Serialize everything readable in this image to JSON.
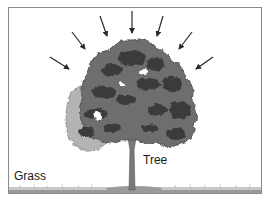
{
  "diagram": {
    "title": "",
    "labels": {
      "tree": "Tree",
      "grass": "Grass"
    },
    "elements": {
      "arrows": {
        "semantic": "sunlight-rays",
        "count": 7,
        "direction": "converging-toward-tree-canopy"
      },
      "tree": {
        "semantic": "tree",
        "parts": [
          "canopy",
          "trunk",
          "branches"
        ]
      },
      "ground": {
        "semantic": "grass-ground-strip"
      }
    },
    "colors": {
      "frame_border": "#8a8a8a",
      "arrow": "#2a2a2a",
      "canopy_dark": "#3a3a3a",
      "canopy_mid": "#6e6e6e",
      "canopy_light": "#b4b4b4",
      "trunk": "#7a7a7a",
      "ground": "#9a9a9a",
      "label_text": "#1a1a1a"
    }
  }
}
